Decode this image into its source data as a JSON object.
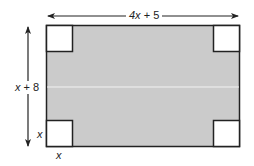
{
  "diagram": {
    "type": "geometry-figure",
    "colors": {
      "fill": "#cbcbcb",
      "stroke": "#222222",
      "corner_fill": "#ffffff",
      "background": "#ffffff"
    },
    "labels": {
      "width": {
        "var": "4x",
        "rest": " + 5"
      },
      "height": {
        "var": "x",
        "rest": " + 8"
      },
      "corner_side_vertical": "x",
      "corner_side_horizontal": "x"
    },
    "shapes": {
      "outer_rectangle": {
        "x": 46,
        "y": 25,
        "width": 194,
        "height": 122
      },
      "corner_squares": [
        {
          "position": "top-left",
          "x": 46,
          "y": 25,
          "size": 26
        },
        {
          "position": "top-right",
          "x": 214,
          "y": 25,
          "size": 26
        },
        {
          "position": "bottom-left",
          "x": 46,
          "y": 121,
          "size": 26
        },
        {
          "position": "bottom-right",
          "x": 214,
          "y": 121,
          "size": 26
        }
      ]
    }
  }
}
